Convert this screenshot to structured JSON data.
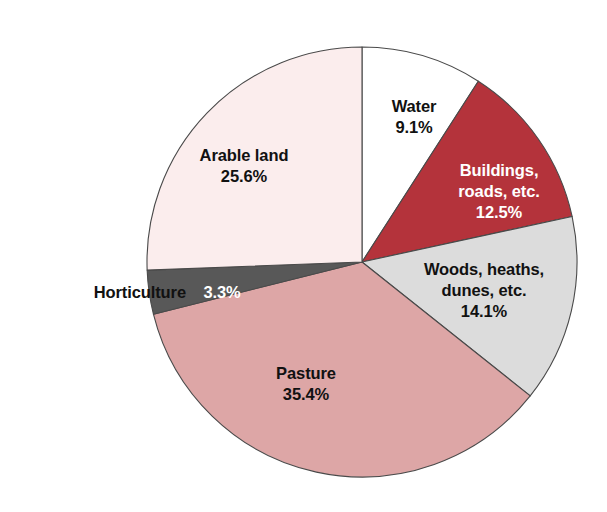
{
  "chart_data": {
    "type": "pie",
    "title": "",
    "subtitle": "",
    "xlabel": "",
    "ylabel": "",
    "legend_position": "none",
    "grid": false,
    "units": "percent",
    "start_angle_deg": 0,
    "direction": "clockwise",
    "total": 100.0,
    "categories": [
      "Water",
      "Buildings, roads, etc.",
      "Woods, heaths, dunes, etc.",
      "Pasture",
      "Horticulture",
      "Arable land"
    ],
    "values": [
      9.1,
      12.5,
      14.1,
      35.4,
      3.3,
      25.6
    ],
    "slices": [
      {
        "name": "Water",
        "label_line1": "Water",
        "value": 9.1,
        "value_label": "9.1%",
        "color": "#ffffff",
        "text_color": "#111111"
      },
      {
        "name": "Buildings, roads, etc.",
        "label_line1": "Buildings,",
        "label_line2": "roads, etc.",
        "value": 12.5,
        "value_label": "12.5%",
        "color": "#b4333b",
        "text_color": "#ffffff"
      },
      {
        "name": "Woods, heaths, dunes, etc.",
        "label_line1": "Woods, heaths,",
        "label_line2": "dunes, etc.",
        "value": 14.1,
        "value_label": "14.1%",
        "color": "#dcdcdc",
        "text_color": "#111111"
      },
      {
        "name": "Pasture",
        "label_line1": "Pasture",
        "value": 35.4,
        "value_label": "35.4%",
        "color": "#dda6a6",
        "text_color": "#111111"
      },
      {
        "name": "Horticulture",
        "label_line1": "Horticulture",
        "value": 3.3,
        "value_label": "3.3%",
        "color": "#585858",
        "text_color": "#ffffff"
      },
      {
        "name": "Arable land",
        "label_line1": "Arable land",
        "value": 25.6,
        "value_label": "25.6%",
        "color": "#fbeded",
        "text_color": "#111111"
      }
    ],
    "geometry": {
      "center_x": 362,
      "center_y": 262,
      "radius": 215
    },
    "outline_color": "#4a4a4a",
    "background_color": "#ffffff"
  }
}
